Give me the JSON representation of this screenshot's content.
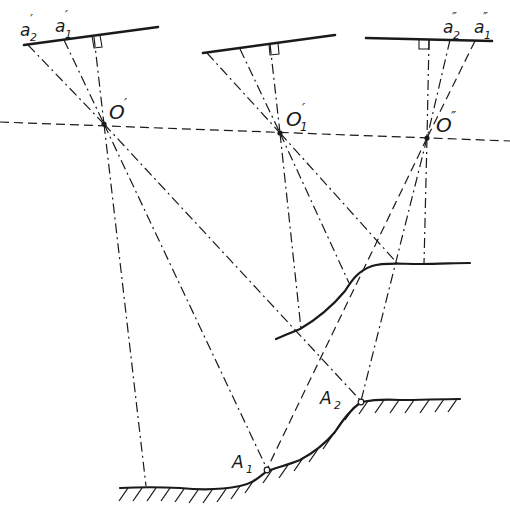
{
  "diagram": {
    "title": "",
    "type": "photogrammetry-stereo-projection",
    "stroke_color": "#1a1a1a",
    "background": "#ffffff",
    "cameras": [
      {
        "id": "left",
        "center_label": "O′",
        "image_points": [
          {
            "label": "a′₂",
            "sub": "2",
            "prime": "′"
          },
          {
            "label": "a′₁",
            "sub": "1",
            "prime": "′"
          }
        ]
      },
      {
        "id": "middle",
        "center_label": "O′₁",
        "image_points": []
      },
      {
        "id": "right",
        "center_label": "O″",
        "image_points": [
          {
            "label": "a″₂",
            "sub": "2",
            "prime": "″"
          },
          {
            "label": "a″₁",
            "sub": "1",
            "prime": "″"
          }
        ]
      }
    ],
    "ground_points": [
      {
        "label": "A₁",
        "base": "A",
        "sub": "1"
      },
      {
        "label": "A₂",
        "base": "A",
        "sub": "2"
      }
    ],
    "labels": {
      "a2_left_base": "a",
      "a2_left_sub": "2",
      "a2_left_prime": "′",
      "a1_left_base": "a",
      "a1_left_sub": "1",
      "a1_left_prime": "′",
      "o_left_base": "O",
      "o_left_prime": "′",
      "o_mid_base": "O",
      "o_mid_sub": "1",
      "o_mid_prime": "′",
      "o_right_base": "O",
      "o_right_prime": "″",
      "a2_right_base": "a",
      "a2_right_sub": "2",
      "a2_right_prime": "″",
      "a1_right_base": "a",
      "a1_right_sub": "1",
      "a1_right_prime": "″",
      "A1_base": "A",
      "A1_sub": "1",
      "A2_base": "A",
      "A2_sub": "2"
    },
    "elements": {
      "baseline": "horizontal dashed line through projection centers",
      "upper_profile": "projected terrain model surface",
      "lower_profile": "actual ground surface with hatching"
    }
  }
}
